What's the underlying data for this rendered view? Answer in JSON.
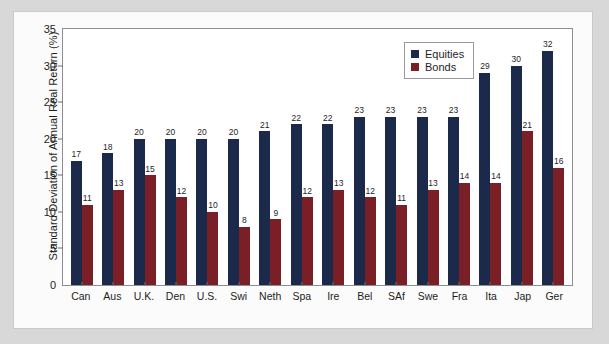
{
  "chart_data": {
    "type": "bar",
    "title": "",
    "xlabel": "",
    "ylabel": "Standard Deviation of Annual Real Return (%)",
    "ylim": [
      0,
      35
    ],
    "yticks": [
      0,
      5,
      10,
      15,
      20,
      25,
      30,
      35
    ],
    "grid": false,
    "legend_position": "top-right",
    "categories": [
      "Can",
      "Aus",
      "U.K.",
      "Den",
      "U.S.",
      "Swi",
      "Neth",
      "Spa",
      "Ire",
      "Bel",
      "SAf",
      "Swe",
      "Fra",
      "Ita",
      "Jap",
      "Ger"
    ],
    "series": [
      {
        "name": "Equities",
        "color": "#1b2a4a",
        "values": [
          17,
          18,
          20,
          20,
          20,
          20,
          21,
          22,
          22,
          23,
          23,
          23,
          23,
          29,
          30,
          32
        ]
      },
      {
        "name": "Bonds",
        "color": "#7b1f27",
        "values": [
          11,
          13,
          15,
          12,
          10,
          8,
          9,
          12,
          13,
          12,
          11,
          13,
          14,
          14,
          21,
          16
        ]
      }
    ]
  },
  "legend": {
    "items": [
      {
        "label": "Equities",
        "color": "#1b2a4a"
      },
      {
        "label": "Bonds",
        "color": "#7b1f27"
      }
    ]
  }
}
